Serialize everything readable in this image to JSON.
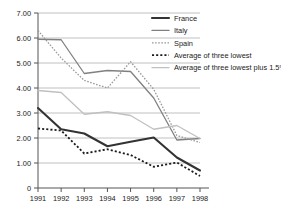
{
  "chart_data": {
    "type": "line",
    "title": "",
    "xlabel": "",
    "ylabel": "",
    "grid": true,
    "legend_position": "top-right",
    "x": [
      1991,
      1992,
      1993,
      1994,
      1995,
      1996,
      1997,
      1998
    ],
    "xticklabels": [
      "1991",
      "1992",
      "1993",
      "1994",
      "1995",
      "1996",
      "1997",
      "1998"
    ],
    "yticklabels": [
      "0",
      "1.00",
      "2.00",
      "3.00",
      "4.00",
      "5.00",
      "6.00",
      "7.00"
    ],
    "yticks": [
      0,
      1,
      2,
      3,
      4,
      5,
      6,
      7
    ],
    "ylim": [
      0,
      7
    ],
    "series": [
      {
        "name": "France",
        "color": "#333333",
        "style": "solid",
        "width": 2.1,
        "values": [
          3.2,
          2.35,
          2.18,
          1.67,
          1.85,
          2.02,
          1.22,
          0.7
        ]
      },
      {
        "name": "Italy",
        "color": "#808080",
        "style": "solid",
        "width": 1.3,
        "values": [
          5.95,
          5.93,
          4.58,
          4.7,
          4.66,
          3.6,
          1.92,
          1.98
        ]
      },
      {
        "name": "Spain",
        "color": "#9a9a9a",
        "style": "dotted",
        "width": 1.3,
        "values": [
          6.3,
          5.2,
          4.3,
          4.0,
          5.05,
          3.95,
          2.1,
          1.82
        ]
      },
      {
        "name": "Average of three lowest",
        "color": "#1a1a1a",
        "style": "dotted",
        "width": 1.8,
        "values": [
          2.38,
          2.3,
          1.38,
          1.55,
          1.32,
          0.85,
          1.02,
          0.48
        ]
      },
      {
        "name": "Average of three lowest plus 1.5%",
        "color": "#c0c0c0",
        "style": "solid",
        "width": 1.3,
        "values": [
          3.9,
          3.82,
          2.95,
          3.05,
          2.9,
          2.35,
          2.5,
          1.98
        ]
      }
    ]
  },
  "axis": {
    "y_tick_0": "0",
    "y_tick_1": "1.00",
    "y_tick_2": "2.00",
    "y_tick_3": "3.00",
    "y_tick_4": "4.00",
    "y_tick_5": "5.00",
    "y_tick_6": "6.00",
    "y_tick_7": "7.00"
  },
  "legend": {
    "items": [
      {
        "label": "France"
      },
      {
        "label": "Italy"
      },
      {
        "label": "Spain"
      },
      {
        "label": "Average of three lowest"
      },
      {
        "label": "Average of three lowest plus 1.5%"
      }
    ]
  }
}
